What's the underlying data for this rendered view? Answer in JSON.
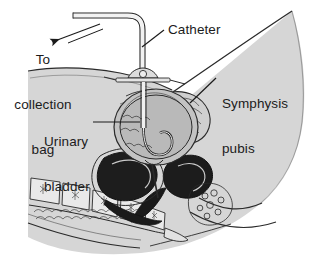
{
  "figure": {
    "background_color": "#ffffff",
    "ink_color": "#1b1b1b",
    "body_fill_color": "#d6d6d6",
    "organ_fill_color": "#b8b8b8",
    "dark_organ_color": "#1a1a1a"
  },
  "labels": {
    "collection_bag": {
      "line1": "To",
      "line2": "collection",
      "line3": "bag"
    },
    "catheter": "Catheter",
    "symphysis_pubis": {
      "line1": "Symphysis",
      "line2": "pubis"
    },
    "urinary_bladder": {
      "line1": "Urinary",
      "line2": "bladder"
    }
  }
}
